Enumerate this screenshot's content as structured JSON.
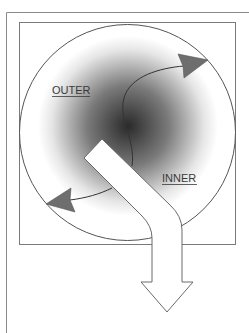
{
  "diagram": {
    "labels": {
      "outer": "OUTER",
      "inner": "INNER"
    },
    "colors": {
      "frame": "#8a8a8a",
      "circle_stroke": "#555555",
      "gradient_center": "#2a2a2a",
      "gradient_edge": "#ffffff",
      "arrowhead_fill": "#6e6e6e",
      "big_arrow_fill": "#ffffff",
      "big_arrow_stroke": "#6a6a6a"
    },
    "elements": [
      "outer-frame",
      "inner-square",
      "gradient-circle",
      "curved-arrow-to-top-right",
      "curved-arrow-to-bottom-left",
      "bent-outflow-arrow-down"
    ]
  }
}
